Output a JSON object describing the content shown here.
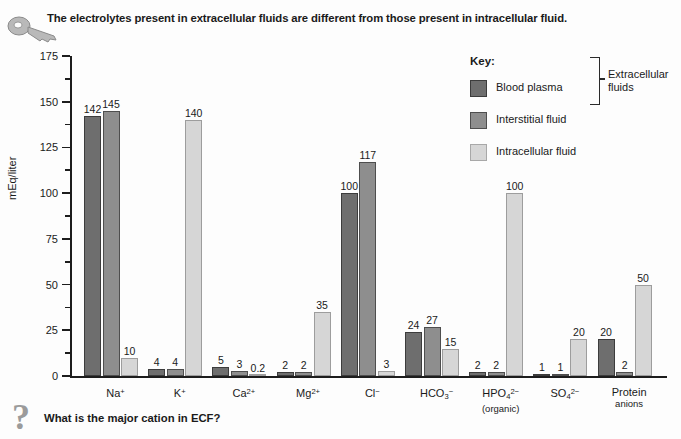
{
  "header": {
    "cut_text": "",
    "title": "The electrolytes present in extracellular fluids are different from those present in intracellular fluid.",
    "key_icon": "key-icon"
  },
  "legend": {
    "title": "Key:",
    "items": [
      {
        "label": "Blood plasma",
        "color": "#6e6e6e"
      },
      {
        "label": "Interstitial fluid",
        "color": "#8e8e8e"
      },
      {
        "label": "Intracellular fluid",
        "color": "#d6d6d6"
      }
    ],
    "bracket_label": "Extracellular fluids",
    "bracket_label_line1": "Extracellular",
    "bracket_label_line2": "fluids"
  },
  "footer": {
    "question": "What is the major cation in ECF?",
    "question_icon": "question-mark-icon"
  },
  "chart_data": {
    "type": "bar",
    "title": "The electrolytes present in extracellular fluids are different from those present in intracellular fluid.",
    "xlabel": "",
    "ylabel": "mEq/liter",
    "ylim": [
      0,
      175
    ],
    "yticks": [
      0,
      25,
      50,
      75,
      100,
      125,
      150,
      175
    ],
    "ytick_labels": [
      "0",
      "25",
      "50",
      "75",
      "100",
      "125",
      "150",
      "175"
    ],
    "minor_tick_step": 12.5,
    "grid": false,
    "legend_position": "upper right",
    "categories": [
      "Na+",
      "K+",
      "Ca2+",
      "Mg2+",
      "Cl-",
      "HCO3-",
      "HPO4 2- (organic)",
      "SO4 2-",
      "Protein anions"
    ],
    "category_labels": [
      {
        "base": "Na",
        "sup": "+",
        "sub": "",
        "line2": ""
      },
      {
        "base": "K",
        "sup": "+",
        "sub": "",
        "line2": ""
      },
      {
        "base": "Ca",
        "sup": "2+",
        "sub": "",
        "line2": ""
      },
      {
        "base": "Mg",
        "sup": "2+",
        "sub": "",
        "line2": ""
      },
      {
        "base": "Cl",
        "sup": "−",
        "sub": "",
        "line2": ""
      },
      {
        "base": "HCO",
        "sup": "−",
        "sub": "3",
        "line2": ""
      },
      {
        "base": "HPO",
        "sup": "2−",
        "sub": "4",
        "line2": "(organic)"
      },
      {
        "base": "SO",
        "sup": "2−",
        "sub": "4",
        "line2": ""
      },
      {
        "base": "Protein",
        "sup": "",
        "sub": "",
        "line2": "anions"
      }
    ],
    "series": [
      {
        "name": "Blood plasma",
        "color": "#6e6e6e",
        "values": [
          142,
          4,
          5,
          2,
          100,
          24,
          2,
          1,
          20
        ]
      },
      {
        "name": "Interstitial fluid",
        "color": "#8e8e8e",
        "values": [
          145,
          4,
          3,
          2,
          117,
          27,
          2,
          1,
          2
        ]
      },
      {
        "name": "Intracellular fluid",
        "color": "#d6d6d6",
        "values": [
          10,
          140,
          0.2,
          35,
          3,
          15,
          100,
          20,
          50
        ]
      }
    ],
    "value_labels": [
      [
        "142",
        "145",
        "10"
      ],
      [
        "4",
        "4",
        "140"
      ],
      [
        "5",
        "3",
        "0.2"
      ],
      [
        "2",
        "2",
        "35"
      ],
      [
        "100",
        "117",
        "3"
      ],
      [
        "24",
        "27",
        "15"
      ],
      [
        "2",
        "2",
        "100"
      ],
      [
        "1",
        "1",
        "20"
      ],
      [
        "20",
        "2",
        "50"
      ]
    ]
  }
}
